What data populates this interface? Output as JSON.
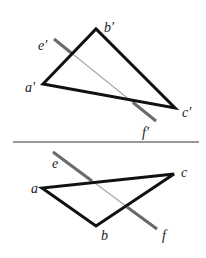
{
  "figure": {
    "colors": {
      "triangle": "#111111",
      "line_visible": "#6a6a6a",
      "line_hidden": "#a0a0a0",
      "axis": "#333333"
    },
    "front_view": {
      "vertices": {
        "a": {
          "label": "a′",
          "x": 43,
          "y": 84
        },
        "b": {
          "label": "b′",
          "x": 96,
          "y": 29
        },
        "c": {
          "label": "c′",
          "x": 175,
          "y": 108
        }
      },
      "line": {
        "start": {
          "label": "e′",
          "x": 54,
          "y": 39
        },
        "end": {
          "label": "f′",
          "x": 156,
          "y": 121
        }
      }
    },
    "axis_line": {
      "x1": 13,
      "y1": 142,
      "x2": 199,
      "y2": 142
    },
    "top_view": {
      "vertices": {
        "a": {
          "label": "a",
          "x": 42,
          "y": 188
        },
        "b": {
          "label": "b",
          "x": 96,
          "y": 226
        },
        "c": {
          "label": "c",
          "x": 174,
          "y": 174
        }
      },
      "line": {
        "start": {
          "label": "e",
          "x": 53,
          "y": 152
        },
        "end": {
          "label": "f",
          "x": 157,
          "y": 229
        }
      }
    }
  }
}
